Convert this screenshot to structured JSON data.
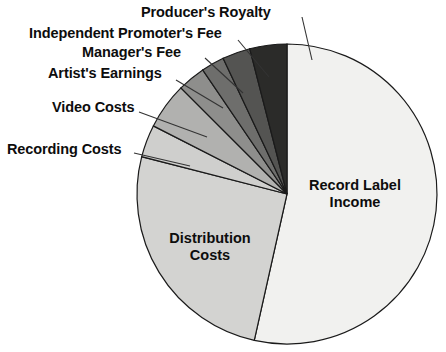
{
  "chart_data": {
    "type": "pie",
    "title": "",
    "subtitle": "",
    "xlabel": "",
    "ylabel": "",
    "grid": false,
    "legend_position": "none",
    "label_placement": "callout-and-inside",
    "center": {
      "x": 287,
      "y": 194
    },
    "radius": 150,
    "start_angle_deg": 0,
    "direction": "clockwise",
    "categories": [
      "Record Label Income",
      "Distribution Costs",
      "Recording Costs",
      "Video Costs",
      "Artist's Earnings",
      "Manager's Fee",
      "Independent Promoter's Fee",
      "Producer's Royalty"
    ],
    "values": [
      53.5,
      25.5,
      3.5,
      5.0,
      3.0,
      2.5,
      3.0,
      4.0
    ],
    "colors": [
      "#f1f1ef",
      "#d3d3d1",
      "#cfcfcd",
      "#b1b1af",
      "#8e8e8c",
      "#6e6e6c",
      "#545452",
      "#2b2b29"
    ],
    "slices": [
      {
        "label": "Record Label Income",
        "value": 53.5,
        "color": "#f1f1ef",
        "start_deg": 0.0,
        "end_deg": 192.6,
        "label_mode": "inside"
      },
      {
        "label": "Distribution Costs",
        "value": 25.5,
        "color": "#d3d3d1",
        "start_deg": 192.6,
        "end_deg": 284.4,
        "label_mode": "inside"
      },
      {
        "label": "Recording Costs",
        "value": 3.5,
        "color": "#cfcfcd",
        "start_deg": 284.4,
        "end_deg": 297.0,
        "label_mode": "callout"
      },
      {
        "label": "Video Costs",
        "value": 5.0,
        "color": "#b1b1af",
        "start_deg": 297.0,
        "end_deg": 315.0,
        "label_mode": "callout"
      },
      {
        "label": "Artist's Earnings",
        "value": 3.0,
        "color": "#8e8e8c",
        "start_deg": 315.0,
        "end_deg": 325.8,
        "label_mode": "callout"
      },
      {
        "label": "Manager's Fee",
        "value": 2.5,
        "color": "#6e6e6c",
        "start_deg": 325.8,
        "end_deg": 334.8,
        "label_mode": "callout"
      },
      {
        "label": "Independent Promoter's Fee",
        "value": 3.0,
        "color": "#545452",
        "start_deg": 334.8,
        "end_deg": 345.6,
        "label_mode": "callout"
      },
      {
        "label": "Producer's Royalty",
        "value": 4.0,
        "color": "#2b2b29",
        "start_deg": 345.6,
        "end_deg": 360.0,
        "label_mode": "callout"
      }
    ]
  },
  "labels": {
    "producers_royalty": "Producer's Royalty",
    "independent_promoters_fee": "Independent Promoter's Fee",
    "managers_fee": "Manager's Fee",
    "artists_earnings": "Artist's Earnings",
    "video_costs": "Video Costs",
    "recording_costs": "Recording Costs",
    "record_label_income_line1": "Record Label",
    "record_label_income_line2": "Income",
    "distribution_costs_line1": "Distribution",
    "distribution_costs_line2": "Costs"
  }
}
